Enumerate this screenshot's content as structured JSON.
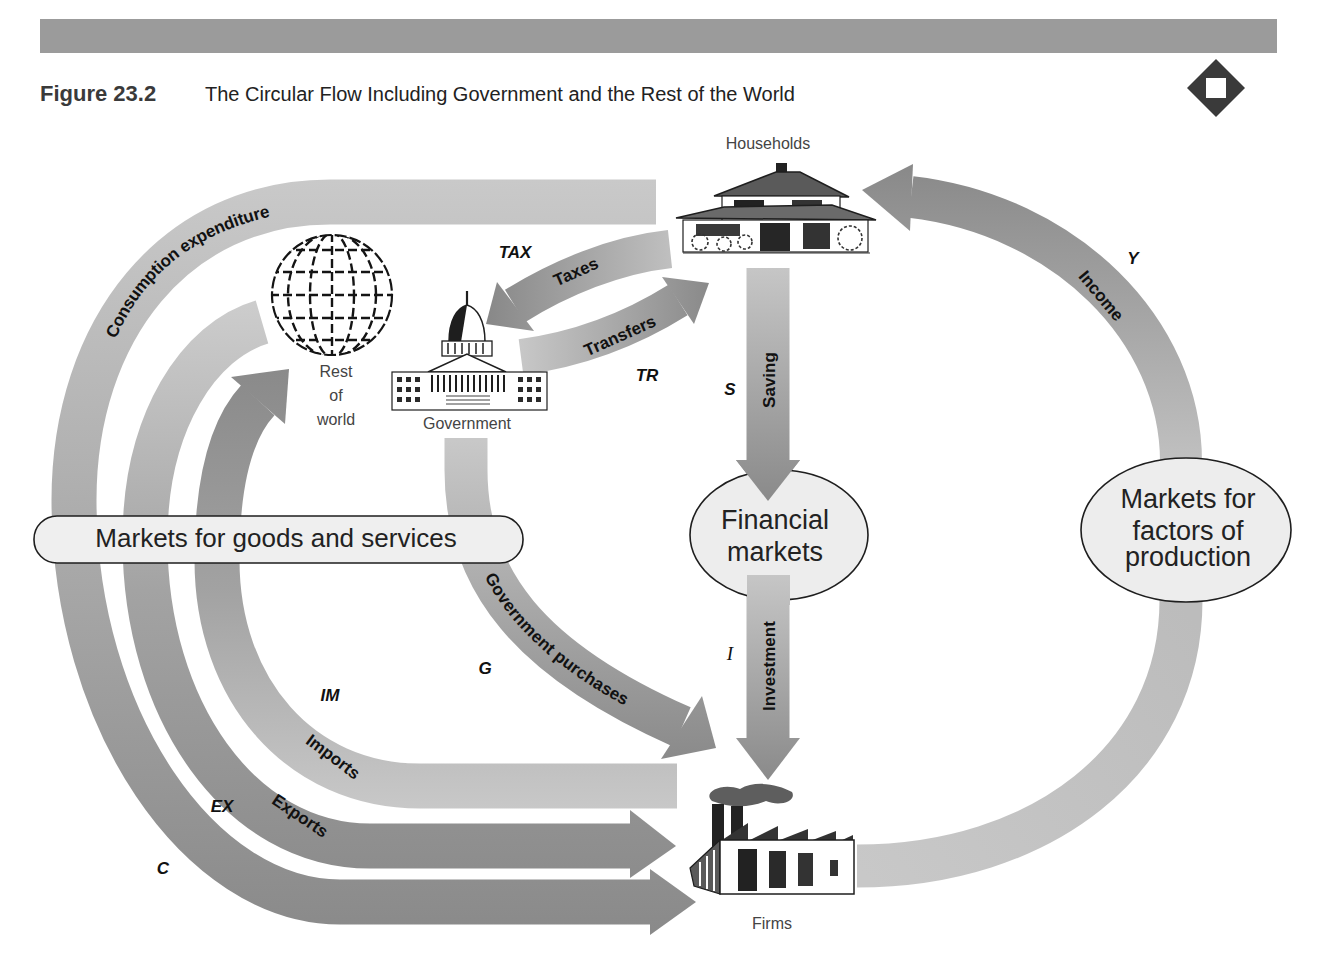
{
  "figure": {
    "number": "Figure 23.2",
    "title": "The Circular Flow Including Government and the Rest of the World",
    "corner_icon": "diamond-square-icon"
  },
  "nodes": {
    "households": "Households",
    "rest_of_world": [
      "Rest",
      "of",
      "world"
    ],
    "government": "Government",
    "firms": "Firms"
  },
  "markets": {
    "goods_services": "Markets for goods and services",
    "financial": [
      "Financial",
      "markets"
    ],
    "factors": [
      "Markets for",
      "factors of",
      "production"
    ]
  },
  "flows": {
    "consumption": {
      "label": "Consumption expenditure",
      "symbol": "C",
      "from": "Households",
      "to": "Firms"
    },
    "exports": {
      "label": "Exports",
      "symbol": "EX",
      "from": "Rest of world",
      "to": "Firms"
    },
    "imports": {
      "label": "Imports",
      "symbol": "IM",
      "from": "Firms",
      "to": "Rest of world"
    },
    "government_purchases": {
      "label": "Government purchases",
      "symbol": "G",
      "from": "Government",
      "to": "Firms"
    },
    "taxes": {
      "label": "Taxes",
      "symbol": "TAX",
      "from": "Households",
      "to": "Government"
    },
    "transfers": {
      "label": "Transfers",
      "symbol": "TR",
      "from": "Government",
      "to": "Households"
    },
    "saving": {
      "label": "Saving",
      "symbol": "S",
      "from": "Households",
      "to": "Financial markets"
    },
    "investment": {
      "label": "Investment",
      "symbol": "I",
      "from": "Financial markets",
      "to": "Firms"
    },
    "income": {
      "label": "Income",
      "symbol": "Y",
      "from": "Markets for factors of production",
      "to": "Households"
    }
  },
  "colors": {
    "header_band": "#9b9b9b",
    "band_dark": "#8a8a8a",
    "band_mid": "#a6a6a6",
    "band_light": "#c9c9c9",
    "ellipse_fill": "#ededed",
    "icon_dark": "#3a3a3a"
  }
}
